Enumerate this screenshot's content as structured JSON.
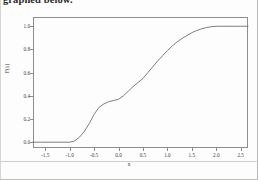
{
  "document": {
    "heading_text": "graphed below."
  },
  "figure": {
    "axis_color": "#8e8e8e",
    "curve_color": "#6f6f6f",
    "text_color": "#3a3a3a"
  },
  "chart_data": {
    "type": "line",
    "title": "",
    "xlabel": "x",
    "ylabel": "F(x)",
    "xlim": [
      -1.75,
      2.65
    ],
    "ylim": [
      -0.05,
      1.08
    ],
    "grid": false,
    "legend": null,
    "xticks": [
      -1.5,
      -1.0,
      -0.5,
      0.0,
      0.5,
      1.0,
      1.5,
      2.0,
      2.5
    ],
    "xticklabels": [
      "-1.5",
      "-1.0",
      "-0.5",
      "0.0",
      "0.5",
      "1.0",
      "1.5",
      "2.0",
      "2.5"
    ],
    "yticks": [
      0.0,
      0.2,
      0.4,
      0.6,
      0.8,
      1.0
    ],
    "yticklabels": [
      "0.0",
      "0.2",
      "0.4",
      "0.6",
      "0.8",
      "1.0"
    ],
    "series": [
      {
        "name": "F(x)",
        "x": [
          -1.75,
          -1.6,
          -1.4,
          -1.2,
          -1.0,
          -0.9,
          -0.8,
          -0.7,
          -0.6,
          -0.5,
          -0.4,
          -0.3,
          -0.2,
          -0.1,
          0.0,
          0.1,
          0.2,
          0.3,
          0.4,
          0.5,
          0.6,
          0.7,
          0.8,
          0.9,
          1.0,
          1.1,
          1.2,
          1.3,
          1.4,
          1.5,
          1.6,
          1.7,
          1.8,
          1.9,
          2.0,
          2.1,
          2.2,
          2.3,
          2.4,
          2.5,
          2.65
        ],
        "y": [
          0.0,
          0.0,
          0.0,
          0.0,
          0.0,
          0.011,
          0.043,
          0.093,
          0.16,
          0.24,
          0.3,
          0.33,
          0.35,
          0.36,
          0.37,
          0.4,
          0.44,
          0.48,
          0.515,
          0.55,
          0.6,
          0.65,
          0.7,
          0.745,
          0.79,
          0.83,
          0.865,
          0.895,
          0.92,
          0.945,
          0.963,
          0.978,
          0.989,
          0.996,
          1.0,
          1.0,
          1.0,
          1.0,
          1.0,
          1.0,
          1.0
        ]
      }
    ]
  }
}
